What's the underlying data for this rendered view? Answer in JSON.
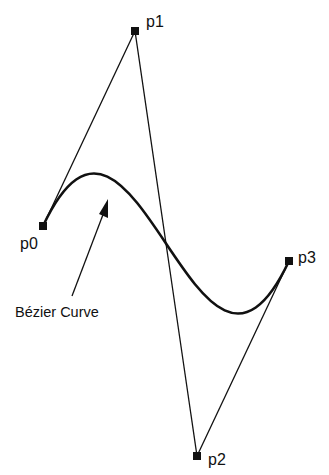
{
  "diagram": {
    "colors": {
      "background": "#ffffff",
      "ink": "#111111"
    },
    "control_points": [
      {
        "id": "p0",
        "label": "p0"
      },
      {
        "id": "p1",
        "label": "p1"
      },
      {
        "id": "p2",
        "label": "p2"
      },
      {
        "id": "p3",
        "label": "p3"
      }
    ],
    "control_polygon": [
      {
        "from": "p0",
        "to": "p1"
      },
      {
        "from": "p1",
        "to": "p2"
      },
      {
        "from": "p2",
        "to": "p3"
      }
    ],
    "curve": {
      "type": "cubic-bezier",
      "points": [
        "p0",
        "p1",
        "p2",
        "p3"
      ]
    },
    "annotation": {
      "text": "Bézier Curve",
      "points_to": "curve"
    }
  }
}
